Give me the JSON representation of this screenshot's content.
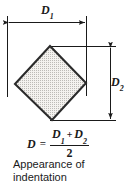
{
  "figure": {
    "name": "appearance-of-indentation",
    "caption_lines": [
      "Appearance of",
      "indentation"
    ],
    "caption_full": "Appearance of indentation"
  },
  "dimensions": {
    "d1": {
      "symbol": "D",
      "subscript": "1",
      "orientation": "horizontal",
      "position": "top"
    },
    "d2": {
      "symbol": "D",
      "subscript": "2",
      "orientation": "vertical",
      "position": "right"
    }
  },
  "formula": {
    "result_symbol": "D",
    "equals": "=",
    "numerator_left_symbol": "D",
    "numerator_left_sub": "1",
    "plus": "+",
    "numerator_right_symbol": "D",
    "numerator_right_sub": "2",
    "denominator": "2",
    "text": "D = (D1 + D2) / 2"
  },
  "shape": {
    "name": "indentation-diamond",
    "description": "rotated square indentation with stippled fill",
    "vertices": [
      [
        50,
        46
      ],
      [
        86,
        83
      ],
      [
        52,
        120
      ],
      [
        15,
        84
      ]
    ],
    "fill_pattern": "stipple-dots",
    "fill_color": "#f0eeea",
    "outline_color": "#2b2b2b"
  },
  "colors": {
    "line": "#1a1a1a",
    "outline": "#2b2b2b",
    "fill": "#f0eeea",
    "stipple": "#b8b6b2",
    "background": "#ffffff",
    "text": "#1a1a1a"
  }
}
